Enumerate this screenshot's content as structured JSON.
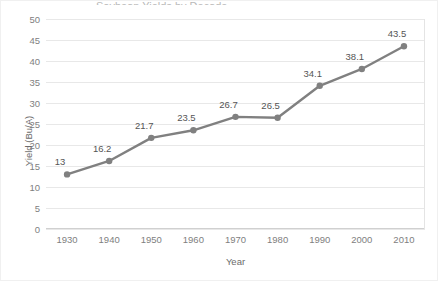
{
  "chart_data": {
    "type": "line",
    "title": "",
    "xlabel": "Year",
    "ylabel": "Yield (Bu/A)",
    "categories": [
      1930,
      1940,
      1950,
      1960,
      1970,
      1980,
      1990,
      2000,
      2010
    ],
    "x_tick_labels": [
      "1930",
      "1940",
      "1950",
      "1960",
      "1970",
      "1980",
      "1990",
      "2000",
      "2010"
    ],
    "values": [
      13,
      16.2,
      21.7,
      23.5,
      26.7,
      26.5,
      34.1,
      38.1,
      43.5
    ],
    "data_labels": [
      "13",
      "16.2",
      "21.7",
      "23.5",
      "26.7",
      "26.5",
      "34.1",
      "38.1",
      "43.5"
    ],
    "ylim": [
      0,
      50
    ],
    "y_tick_labels": [
      "0",
      "5",
      "10",
      "15",
      "20",
      "25",
      "30",
      "35",
      "40",
      "45",
      "50"
    ],
    "y_ticks": [
      0,
      5,
      10,
      15,
      20,
      25,
      30,
      35,
      40,
      45,
      50
    ],
    "grid": "horizontal",
    "legend": "none",
    "series": [
      {
        "name": "Yield",
        "values": [
          13,
          16.2,
          21.7,
          23.5,
          26.7,
          26.5,
          34.1,
          38.1,
          43.5
        ],
        "line_color": "#808080",
        "marker_color": "#808080",
        "marker": "circle"
      }
    ],
    "colors": {
      "line": "#808080",
      "marker": "#808080",
      "gridline": "#e8e8e8",
      "axis": "#d0d0d0",
      "tick_text": "#808080",
      "label_text": "#555555",
      "background": "#ffffff"
    },
    "title_remnant": "Soybean Yields by Decade"
  }
}
